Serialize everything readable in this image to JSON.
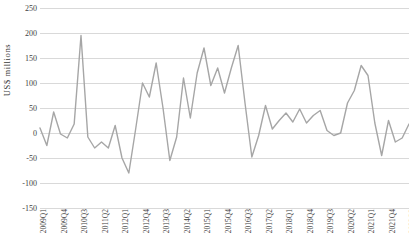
{
  "chart_data": {
    "type": "line",
    "title": "",
    "xlabel": "",
    "ylabel": "US$ millions",
    "ylim": [
      -150,
      250
    ],
    "ytick_labels": [
      "250",
      "200",
      "150",
      "100",
      "50",
      "0",
      "-50",
      "-100",
      "-150"
    ],
    "ytick_values": [
      250,
      200,
      150,
      100,
      50,
      0,
      -50,
      -100,
      -150
    ],
    "grid": true,
    "legend": "none",
    "line_color": "#a6a6a6",
    "x": [
      "2009Q1",
      "2009Q2",
      "2009Q3",
      "2009Q4",
      "2010Q1",
      "2010Q2",
      "2010Q3",
      "2010Q4",
      "2011Q1",
      "2011Q2",
      "2011Q3",
      "2011Q4",
      "2012Q1",
      "2012Q2",
      "2012Q3",
      "2012Q4",
      "2013Q1",
      "2013Q2",
      "2013Q3",
      "2013Q4",
      "2014Q1",
      "2014Q2",
      "2014Q3",
      "2014Q4",
      "2015Q1",
      "2015Q2",
      "2015Q3",
      "2015Q4",
      "2016Q1",
      "2016Q2",
      "2016Q3",
      "2016Q4",
      "2017Q1",
      "2017Q2",
      "2017Q3",
      "2017Q4",
      "2018Q1",
      "2018Q2",
      "2018Q3",
      "2018Q4",
      "2019Q1",
      "2019Q2",
      "2019Q3",
      "2019Q4",
      "2020Q1",
      "2020Q2",
      "2020Q3",
      "2020Q4",
      "2021Q1",
      "2021Q2",
      "2021Q3",
      "2021Q4",
      "2022Q1",
      "2022Q2",
      "2022Q3"
    ],
    "xtick_labels_shown": [
      "2009Q1",
      "2009Q4",
      "2010Q3",
      "2011Q2",
      "2012Q1",
      "2012Q4",
      "2013Q3",
      "2014Q2",
      "2015Q1",
      "2015Q4",
      "2016Q3",
      "2017Q2",
      "2018Q1",
      "2018Q4",
      "2019Q3",
      "2020Q2",
      "2021Q1",
      "2021Q4",
      "2022Q3"
    ],
    "xtick_label_indices": [
      0,
      3,
      6,
      9,
      12,
      15,
      18,
      21,
      24,
      27,
      30,
      33,
      36,
      39,
      42,
      45,
      48,
      51,
      54
    ],
    "values": [
      10,
      -25,
      42,
      -2,
      -10,
      18,
      195,
      -8,
      -30,
      -18,
      -30,
      15,
      -50,
      -80,
      8,
      100,
      72,
      140,
      50,
      -55,
      -8,
      110,
      30,
      120,
      170,
      95,
      130,
      80,
      130,
      175,
      60,
      -48,
      -5,
      55,
      8,
      25,
      40,
      22,
      48,
      20,
      35,
      45,
      5,
      -5,
      0,
      60,
      85,
      135,
      115,
      20,
      -45,
      25,
      -18,
      -10,
      18
    ]
  }
}
